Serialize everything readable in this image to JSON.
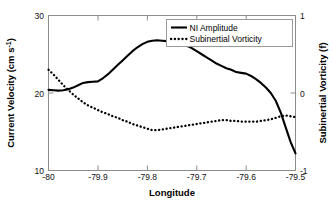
{
  "chart_data": {
    "type": "line",
    "title": "",
    "xlabel": "Longitude",
    "ylabel": "Current Velocity (cm s-1)",
    "ylabel_main": "Current Velocity (cm s",
    "ylabel_exp": "-1",
    "ylabel_tail": ")",
    "y2label": "Subinertial Vorticity (f)",
    "xlim": [
      -80.0,
      -79.5
    ],
    "ylim": [
      10,
      30
    ],
    "y2lim": [
      -1,
      1
    ],
    "grid": false,
    "legend_position": "top-right",
    "xticks": [
      -80,
      -79.9,
      -79.8,
      -79.7,
      -79.6,
      -79.5
    ],
    "xticklabels": [
      "-80",
      "-79.9",
      "-79.8",
      "-79.7",
      "-79.6",
      "-79.5"
    ],
    "yticks": [
      10,
      20,
      30
    ],
    "yticklabels": [
      "10",
      "20",
      "30"
    ],
    "y2ticks": [
      -1,
      0,
      1
    ],
    "y2ticklabels": [
      "-1",
      "0",
      "1"
    ],
    "series": [
      {
        "name": "NI Amplitude",
        "style": "solid",
        "axis": "left",
        "units": "cm s-1",
        "x": [
          -80.0,
          -79.99,
          -79.98,
          -79.97,
          -79.96,
          -79.95,
          -79.94,
          -79.93,
          -79.92,
          -79.91,
          -79.9,
          -79.89,
          -79.88,
          -79.87,
          -79.86,
          -79.85,
          -79.84,
          -79.83,
          -79.82,
          -79.81,
          -79.8,
          -79.79,
          -79.78,
          -79.77,
          -79.76,
          -79.75,
          -79.74,
          -79.73,
          -79.72,
          -79.71,
          -79.7,
          -79.69,
          -79.68,
          -79.67,
          -79.66,
          -79.65,
          -79.64,
          -79.63,
          -79.62,
          -79.61,
          -79.6,
          -79.59,
          -79.58,
          -79.57,
          -79.56,
          -79.55,
          -79.54,
          -79.53,
          -79.52,
          -79.51,
          -79.5
        ],
        "y": [
          20.4,
          20.35,
          20.3,
          20.35,
          20.5,
          20.7,
          21.0,
          21.3,
          21.4,
          21.45,
          21.5,
          21.9,
          22.4,
          23.0,
          23.6,
          24.2,
          24.8,
          25.4,
          25.9,
          26.3,
          26.6,
          26.75,
          26.8,
          26.75,
          26.7,
          26.6,
          26.55,
          26.4,
          26.1,
          25.8,
          25.4,
          25.0,
          24.6,
          24.2,
          23.8,
          23.5,
          23.2,
          23.0,
          22.7,
          22.6,
          22.5,
          22.2,
          21.8,
          21.3,
          20.7,
          20.0,
          19.0,
          17.5,
          15.6,
          13.7,
          12.2
        ]
      },
      {
        "name": "Subinertial Vorticity",
        "style": "dotted",
        "axis": "right",
        "units": "f",
        "x": [
          -80.0,
          -79.99,
          -79.98,
          -79.97,
          -79.96,
          -79.95,
          -79.94,
          -79.93,
          -79.92,
          -79.91,
          -79.9,
          -79.89,
          -79.88,
          -79.87,
          -79.86,
          -79.85,
          -79.84,
          -79.83,
          -79.82,
          -79.81,
          -79.8,
          -79.79,
          -79.78,
          -79.77,
          -79.76,
          -79.75,
          -79.74,
          -79.73,
          -79.72,
          -79.71,
          -79.7,
          -79.69,
          -79.68,
          -79.67,
          -79.66,
          -79.65,
          -79.64,
          -79.63,
          -79.62,
          -79.61,
          -79.6,
          -79.59,
          -79.58,
          -79.57,
          -79.56,
          -79.55,
          -79.54,
          -79.53,
          -79.52,
          -79.51,
          -79.5
        ],
        "y": [
          0.3,
          0.24,
          0.17,
          0.1,
          0.04,
          -0.02,
          -0.07,
          -0.12,
          -0.16,
          -0.19,
          -0.22,
          -0.25,
          -0.27,
          -0.3,
          -0.32,
          -0.35,
          -0.37,
          -0.4,
          -0.42,
          -0.44,
          -0.46,
          -0.48,
          -0.48,
          -0.47,
          -0.46,
          -0.45,
          -0.44,
          -0.43,
          -0.42,
          -0.41,
          -0.4,
          -0.39,
          -0.38,
          -0.37,
          -0.36,
          -0.35,
          -0.35,
          -0.36,
          -0.36,
          -0.37,
          -0.37,
          -0.37,
          -0.37,
          -0.36,
          -0.35,
          -0.34,
          -0.32,
          -0.3,
          -0.29,
          -0.3,
          -0.31
        ]
      }
    ],
    "annotations": []
  },
  "legend": {
    "entries": [
      {
        "label": "NI Amplitude",
        "style": "solid"
      },
      {
        "label": "Subinertial Vorticity",
        "style": "dotted"
      }
    ]
  }
}
